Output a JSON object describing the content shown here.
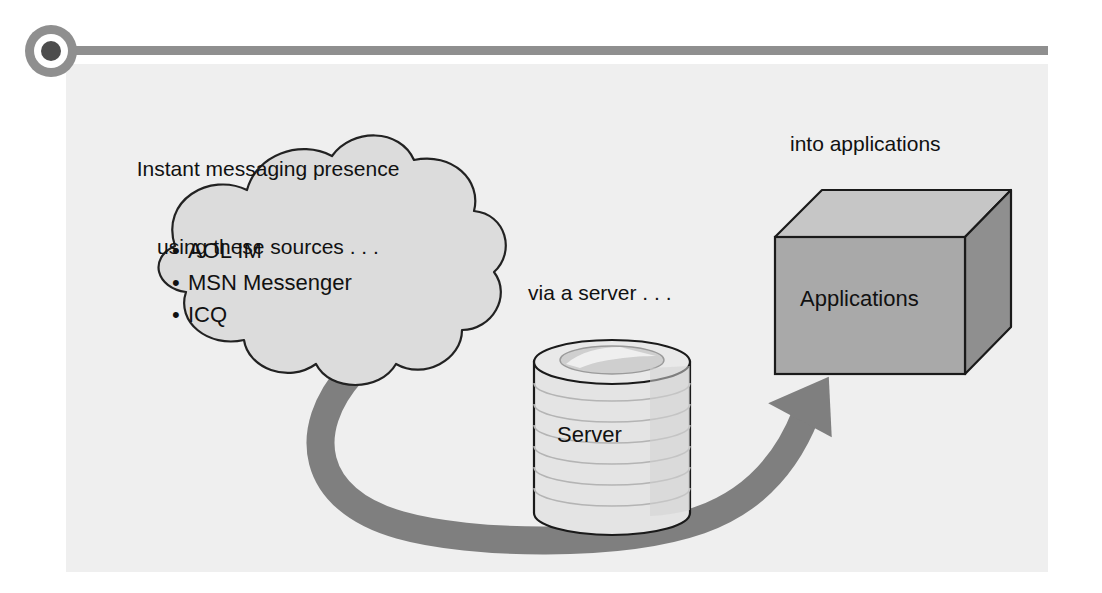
{
  "figure": {
    "panel_background": "#efefef",
    "rule_color": "#8f8f8f",
    "arrow_color": "#7f7f7f",
    "marker": {
      "icon": "bullet-dot-icon",
      "outer_color": "#8f8f8f",
      "inner_color": "#ffffff",
      "core_color": "#4d4d4d"
    }
  },
  "labels": {
    "source_heading_line1": "Instant messaging presence",
    "source_heading_line2": "using these sources . . .",
    "via_server": "via a server . . .",
    "into_applications": "into applications"
  },
  "cloud": {
    "name": "instant-messaging-sources-cloud",
    "fill": "#dcdcdc",
    "stroke": "#222222",
    "bullet_glyph": "•",
    "items": [
      "AOL IM",
      "MSN Messenger",
      "ICQ"
    ]
  },
  "server": {
    "name": "server-cylinder",
    "label": "Server",
    "fill": "#e2e2e2",
    "stroke": "#1a1a1a",
    "disk_count": 7
  },
  "applications": {
    "name": "applications-box",
    "label": "Applications",
    "front_fill": "#a8a8a8",
    "top_fill": "#c6c6c6",
    "side_fill": "#8c8c8c",
    "stroke": "#1a1a1a"
  },
  "arrow": {
    "name": "flow-arrow",
    "from": "instant-messaging-sources-cloud",
    "through": "server-cylinder",
    "to": "applications-box",
    "color": "#7f7f7f"
  }
}
